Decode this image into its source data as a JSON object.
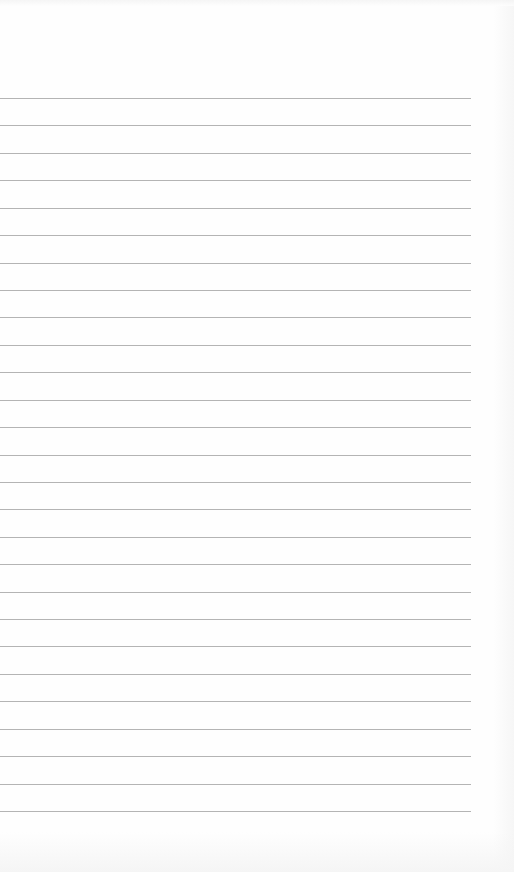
{
  "document": {
    "type": "lined-paper",
    "background_color": "#fefefe",
    "rule_color": "#b4b4b4",
    "rule_left": 0,
    "rule_width": 471,
    "rule_count": 27,
    "first_rule_y": 98,
    "last_rule_y": 811,
    "text_lines": []
  }
}
